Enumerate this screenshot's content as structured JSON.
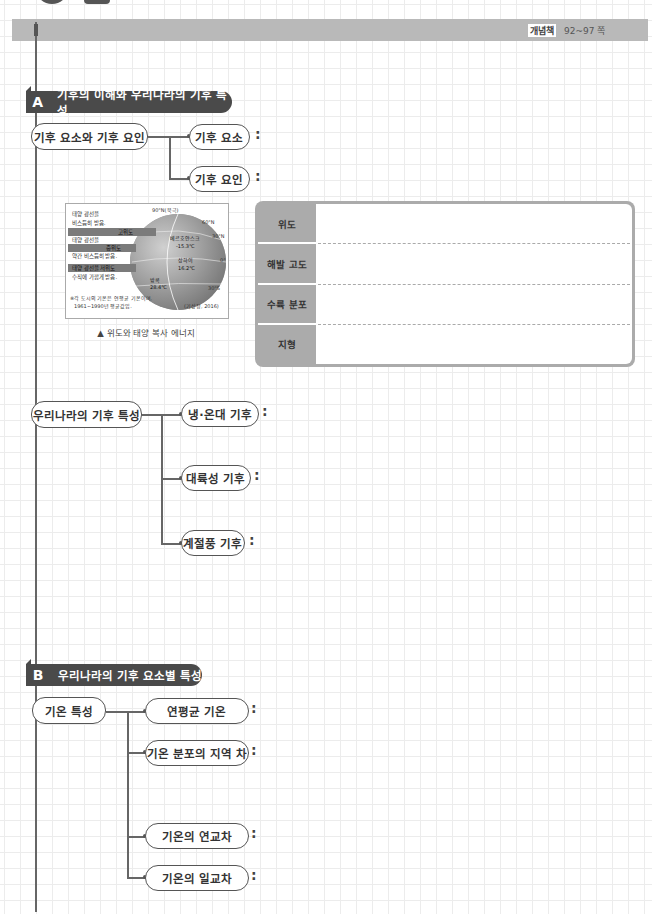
{
  "header": {
    "book_label": "개념책",
    "page_ref": "92~97 쪽"
  },
  "section_a": {
    "letter": "A",
    "title": "기후의 이해와 우리나라의 기후 특성",
    "group1": {
      "root": "기후 요소와 기후 요인",
      "children": [
        {
          "label": "기후 요소",
          "colon": ":"
        },
        {
          "label": "기후 요인",
          "colon": ":"
        }
      ]
    },
    "figure": {
      "caption": "▲ 위도와 태양 복사 에너지",
      "labels": {
        "high_text1": "태양 광선을",
        "high_text2": "비스듬히 받음.",
        "high_tag": "고위도",
        "mid_text1": "태양 광선을",
        "mid_tag": "중위도",
        "mid_text2": "약간 비스듬히 받음.",
        "low_text1": "태양 광선을",
        "low_tag": "저위도",
        "low_text2": "수직에 가깝게 받음.",
        "north_pole": "90°N(북극)",
        "lat60n": "60°N",
        "lat30n": "30°N",
        "lat0": "0°",
        "lat30s": "30°S",
        "city1": "베르호얀스크",
        "city1_temp": "-15.3℃",
        "city2": "상하이",
        "city2_temp": "16.2℃",
        "city3": "방콕",
        "city3_temp": "28.4℃",
        "note1": "※각 도시의 기온은 연평균 기온이며,",
        "note2": "1961~1990년 평균값임.",
        "source": "(기상청, 2016)"
      }
    },
    "factor_table": {
      "rows": [
        {
          "label": "위도",
          "value": ""
        },
        {
          "label": "해발 고도",
          "value": ""
        },
        {
          "label": "수륙 분포",
          "value": ""
        },
        {
          "label": "지형",
          "value": ""
        }
      ]
    },
    "group2": {
      "root": "우리나라의 기후 특성",
      "children": [
        {
          "label": "냉·온대 기후",
          "colon": ":"
        },
        {
          "label": "대륙성 기후",
          "colon": ":"
        },
        {
          "label": "계절풍 기후",
          "colon": ":"
        }
      ]
    }
  },
  "section_b": {
    "letter": "B",
    "title": "우리나라의 기후 요소별 특성",
    "group1": {
      "root": "기온 특성",
      "children": [
        {
          "label": "연평균 기온",
          "colon": ":"
        },
        {
          "label": "기온 분포의 지역 차",
          "colon": ":"
        },
        {
          "label": "기온의 연교차",
          "colon": ":"
        },
        {
          "label": "기온의 일교차",
          "colon": ":"
        }
      ]
    }
  }
}
